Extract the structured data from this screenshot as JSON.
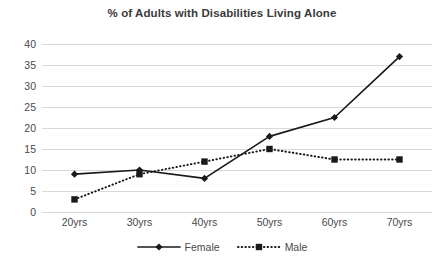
{
  "chart_data": {
    "type": "line",
    "title": "% of Adults with Disabilities Living Alone",
    "xlabel": "",
    "ylabel": "",
    "categories": [
      "20yrs",
      "30yrs",
      "40yrs",
      "50yrs",
      "60yrs",
      "70yrs"
    ],
    "series": [
      {
        "name": "Female",
        "values": [
          9,
          10,
          8,
          18,
          22.5,
          37
        ],
        "marker": "diamond",
        "linestyle": "solid",
        "color": "#1a1a1a"
      },
      {
        "name": "Male",
        "values": [
          3,
          9,
          12,
          15,
          12.5,
          12.5
        ],
        "marker": "square",
        "linestyle": "dotted",
        "color": "#1a1a1a"
      }
    ],
    "ylim": [
      0,
      40
    ],
    "yticks": [
      0,
      5,
      10,
      15,
      20,
      25,
      30,
      35,
      40
    ],
    "ytick_labels": [
      "0",
      "5",
      "10",
      "15",
      "20",
      "25",
      "30",
      "35",
      "40"
    ],
    "grid": "horizontal",
    "legend_position": "bottom",
    "legend_entries": [
      "Female",
      "Male"
    ],
    "gridline_color": "#d9d9d9",
    "text_color": "#4a4a4a",
    "title_color": "#3a3a3a",
    "background": "#ffffff"
  }
}
